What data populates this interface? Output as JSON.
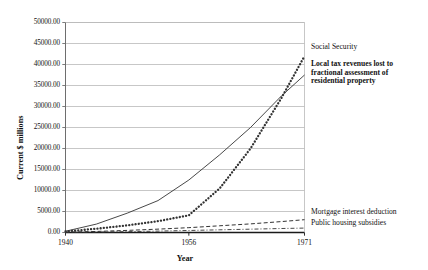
{
  "chart_data": {
    "type": "line",
    "title": "",
    "xlabel": "Year",
    "ylabel": "Current $ millions",
    "xlim": [
      1940,
      1971
    ],
    "ylim": [
      0,
      50000
    ],
    "grid": true,
    "legend_position": "inline-right",
    "x_ticks": [
      "1940",
      "1956",
      "1971"
    ],
    "x_tick_values": [
      1940,
      1956,
      1971
    ],
    "y_ticks": [
      "0.00",
      "5000.00",
      "10000.00",
      "15000.00",
      "20000.00",
      "25000.00",
      "30000.00",
      "35000.00",
      "40000.00",
      "45000.00",
      "50000.00"
    ],
    "y_tick_values": [
      0,
      5000,
      10000,
      15000,
      20000,
      25000,
      30000,
      35000,
      40000,
      45000,
      50000
    ],
    "x": [
      1940,
      1944,
      1948,
      1952,
      1956,
      1960,
      1964,
      1968,
      1971
    ],
    "series": [
      {
        "name": "Social Security",
        "style": "solid",
        "bold_label": false,
        "values": [
          300,
          2000,
          4600,
          7600,
          12500,
          18500,
          25000,
          32500,
          37500
        ]
      },
      {
        "name": "Local tax revenues lost to fractional assessment of residential property",
        "style": "dotted",
        "bold_label": true,
        "values": [
          250,
          900,
          1700,
          2700,
          4100,
          10500,
          20000,
          32000,
          42000
        ]
      },
      {
        "name": "Mortgage interest deduction",
        "style": "dashed",
        "bold_label": false,
        "values": [
          80,
          250,
          500,
          800,
          1150,
          1600,
          2050,
          2600,
          3050
        ]
      },
      {
        "name": "Public housing subsidies",
        "style": "dashdot",
        "bold_label": false,
        "values": [
          20,
          90,
          200,
          330,
          480,
          640,
          790,
          950,
          1050
        ]
      }
    ]
  },
  "colors": {
    "line": "#333333",
    "grid": "#b9b9b9",
    "frame": "#6e6e6e",
    "text": "#111111",
    "background": "#ffffff"
  }
}
